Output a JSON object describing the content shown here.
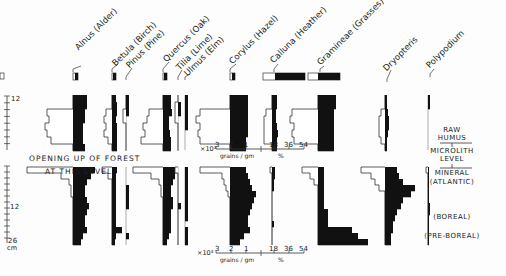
{
  "chart_data": {
    "type": "pollen-diagram",
    "title": "",
    "taxa": [
      {
        "key": "alnus",
        "label": "Alnus (Alder)",
        "x": 73
      },
      {
        "key": "betula",
        "label": "Betula (Birch)",
        "x": 112
      },
      {
        "key": "pinus",
        "label": "Pinus (Pine)",
        "x": 126
      },
      {
        "key": "quercus",
        "label": "Quercus (Oak)",
        "x": 163
      },
      {
        "key": "tilia",
        "label": "Tilia (Lime)",
        "x": 178
      },
      {
        "key": "ulmus",
        "label": "Ulmus (Elm)",
        "x": 185
      },
      {
        "key": "corylus",
        "label": "Corylus (Hazel)",
        "x": 230
      },
      {
        "key": "calluna",
        "label": "Calluna (Heather)",
        "x": 272
      },
      {
        "key": "gramineae",
        "label": "Gramineae (Grasses)",
        "x": 318
      },
      {
        "key": "dryopteris",
        "label": "Dryopteris",
        "x": 385
      },
      {
        "key": "polypodium",
        "label": "Polypodium",
        "x": 428
      }
    ],
    "depth_axis": {
      "unit": "cm",
      "upper_section": {
        "ticks": [
          "12",
          "7"
        ],
        "labels_shown": [
          "12"
        ]
      },
      "lower_section": {
        "ticks": [
          "0",
          "12",
          "26"
        ],
        "labels_shown": [
          "12",
          "26"
        ]
      }
    },
    "scale_bar": {
      "prefix": "×10³",
      "absolute_ticks": [
        "3",
        "2",
        "1"
      ],
      "absolute_unit": "grains / gm",
      "percent_ticks": [
        "18",
        "36",
        "54"
      ],
      "percent_unit": "%"
    },
    "annotations": [
      "OPENING UP OF FOREST",
      "AT THIS LEVEL"
    ],
    "zones": [
      "RAW HUMUS",
      "MICROLITH LEVEL",
      "MINERAL",
      "(ATLANTIC)",
      "(BOREAL)",
      "(PRE-BOREAL)"
    ],
    "note": "Black bars = percentage; open outlines = absolute frequency (×10³ grains/gm), drawn leftwards from baseline.",
    "upper_profile": {
      "y_top": 95,
      "y_bottom": 150,
      "row_h": 7,
      "series": [
        {
          "key": "alnus",
          "pct": [
            14,
            14,
            12,
            12,
            10,
            10,
            10,
            12
          ],
          "abs": [
            0,
            0,
            26,
            24,
            28,
            26,
            22,
            0
          ]
        },
        {
          "key": "betula",
          "pct": [
            4,
            5,
            5,
            4,
            5,
            5,
            5,
            5
          ],
          "abs": [
            0,
            0,
            6,
            8,
            6,
            8,
            4,
            0
          ]
        },
        {
          "key": "pinus",
          "pct": [
            3,
            3,
            3,
            0,
            0,
            0,
            0,
            0
          ],
          "abs": [
            0,
            0,
            3,
            3,
            0,
            0,
            0,
            0
          ]
        },
        {
          "key": "quercus",
          "pct": [
            8,
            8,
            9,
            6,
            6,
            7,
            8,
            8
          ],
          "abs": [
            0,
            0,
            14,
            16,
            20,
            18,
            22,
            0
          ]
        },
        {
          "key": "tilia",
          "pct": [
            0,
            3,
            3,
            0,
            0,
            0,
            0,
            0
          ],
          "abs": [
            0,
            3,
            3,
            3,
            0,
            0,
            0,
            0
          ]
        },
        {
          "key": "ulmus",
          "pct": [
            3,
            3,
            3,
            3,
            3,
            0,
            0,
            0
          ],
          "abs": [
            0,
            0,
            0,
            0,
            0,
            0,
            0,
            0
          ]
        },
        {
          "key": "corylus",
          "pct": [
            18,
            18,
            18,
            18,
            18,
            18,
            16,
            16
          ],
          "abs": [
            0,
            0,
            30,
            34,
            30,
            32,
            30,
            0
          ]
        },
        {
          "key": "calluna",
          "pct": [
            5,
            5,
            4,
            4,
            5,
            6,
            5,
            5
          ],
          "abs": [
            0,
            0,
            6,
            8,
            8,
            8,
            8,
            0
          ]
        },
        {
          "key": "gramineae",
          "pct": [
            18,
            18,
            16,
            16,
            16,
            16,
            16,
            16
          ],
          "abs": [
            0,
            0,
            26,
            28,
            24,
            26,
            24,
            0
          ]
        },
        {
          "key": "dryopteris",
          "pct": [
            2,
            2,
            3,
            4,
            4,
            3,
            2,
            2
          ],
          "abs": [
            0,
            0,
            4,
            6,
            6,
            6,
            4,
            0
          ]
        },
        {
          "key": "polypodium",
          "pct": [
            2,
            2,
            0,
            0,
            0,
            0,
            0,
            0
          ],
          "abs": [
            0,
            0,
            0,
            0,
            0,
            0,
            0,
            0
          ]
        }
      ]
    },
    "lower_profile": {
      "y_top": 167,
      "y_bottom": 245,
      "row_h": 6,
      "series": [
        {
          "key": "alnus",
          "pct": [
            22,
            18,
            14,
            12,
            12,
            14,
            16,
            14,
            12,
            12,
            14,
            10,
            8
          ],
          "abs": [
            46,
            12,
            4,
            2,
            2,
            0,
            0,
            0,
            0,
            0,
            0,
            0,
            0
          ]
        },
        {
          "key": "betula",
          "pct": [
            5,
            4,
            4,
            4,
            4,
            4,
            4,
            4,
            4,
            4,
            10,
            4,
            3
          ],
          "abs": [
            10,
            4,
            0,
            0,
            0,
            0,
            0,
            0,
            0,
            0,
            0,
            0,
            0
          ]
        },
        {
          "key": "pinus",
          "pct": [
            0,
            0,
            0,
            3,
            3,
            3,
            3,
            0,
            0,
            0,
            0,
            3,
            0
          ],
          "abs": [
            0,
            0,
            0,
            0,
            0,
            0,
            0,
            0,
            0,
            0,
            0,
            0,
            0
          ]
        },
        {
          "key": "quercus",
          "pct": [
            14,
            12,
            10,
            8,
            8,
            10,
            10,
            8,
            8,
            8,
            8,
            6,
            4
          ],
          "abs": [
            30,
            12,
            4,
            2,
            2,
            0,
            0,
            0,
            0,
            0,
            0,
            0,
            0
          ]
        },
        {
          "key": "tilia",
          "pct": [
            0,
            0,
            0,
            0,
            0,
            0,
            3,
            0,
            0,
            0,
            0,
            0,
            0
          ],
          "abs": [
            3,
            0,
            0,
            0,
            0,
            0,
            0,
            0,
            0,
            0,
            0,
            0,
            0
          ]
        },
        {
          "key": "ulmus",
          "pct": [
            3,
            3,
            3,
            3,
            3,
            3,
            3,
            3,
            3,
            0,
            3,
            3,
            3
          ],
          "abs": [
            0,
            0,
            0,
            0,
            0,
            0,
            0,
            0,
            0,
            0,
            0,
            0,
            0
          ]
        },
        {
          "key": "corylus",
          "pct": [
            16,
            18,
            20,
            22,
            26,
            24,
            22,
            20,
            18,
            18,
            20,
            14,
            10
          ],
          "abs": [
            30,
            8,
            6,
            4,
            2,
            0,
            0,
            0,
            0,
            0,
            0,
            0,
            0
          ]
        },
        {
          "key": "calluna",
          "pct": [
            3,
            3,
            2,
            2,
            0,
            0,
            0,
            0,
            0,
            2,
            0,
            0,
            0
          ],
          "abs": [
            2,
            0,
            0,
            0,
            0,
            0,
            0,
            0,
            0,
            0,
            0,
            0,
            0
          ]
        },
        {
          "key": "gramineae",
          "pct": [
            6,
            6,
            6,
            6,
            6,
            6,
            6,
            10,
            10,
            10,
            34,
            40,
            50
          ],
          "abs": [
            16,
            8,
            4,
            0,
            0,
            0,
            0,
            0,
            0,
            0,
            0,
            0,
            0
          ]
        },
        {
          "key": "dryopteris",
          "pct": [
            12,
            14,
            18,
            30,
            26,
            18,
            16,
            12,
            10,
            8,
            8,
            6,
            6
          ],
          "abs": [
            24,
            14,
            10,
            6,
            0,
            0,
            0,
            0,
            0,
            0,
            0,
            0,
            0
          ]
        },
        {
          "key": "polypodium",
          "pct": [
            1,
            1,
            1,
            1,
            1,
            1,
            2,
            2,
            1,
            1,
            1,
            1,
            1
          ],
          "abs": [
            2,
            0,
            0,
            0,
            0,
            0,
            0,
            0,
            0,
            0,
            0,
            0,
            0
          ]
        }
      ]
    },
    "surface_legend_bars": [
      {
        "key": "alnus",
        "x": 73,
        "w": 5,
        "open": 2
      },
      {
        "key": "betula",
        "x": 112,
        "w": 4,
        "open": 1
      },
      {
        "key": "quercus",
        "x": 163,
        "w": 4,
        "open": 1
      },
      {
        "key": "corylus",
        "x": 230,
        "w": 5,
        "open": 2
      },
      {
        "key": "calluna",
        "x": 263,
        "w": 42,
        "open": 12
      },
      {
        "key": "gramineae",
        "x": 308,
        "w": 32,
        "open": 10
      }
    ]
  },
  "depth_labels": {
    "upper_12": "12",
    "lower_12": "12",
    "lower_26": "26",
    "unit": "cm"
  },
  "annotation": {
    "line1": "OPENING UP OF FOREST",
    "line2": "AT THIS LEVEL"
  },
  "scale_upper": {
    "prefix": "×10³",
    "t3": "3",
    "t2": "2",
    "t1": "1",
    "p18": "18",
    "p36": "36",
    "p54": "54",
    "abs_unit": "grains / gm",
    "pct_unit": "%"
  },
  "scale_lower": {
    "prefix": "×10³",
    "t3": "3",
    "t2": "2",
    "t1": "1",
    "p18": "18",
    "p36": "36",
    "p54": "54",
    "abs_unit": "grains / gm",
    "pct_unit": "%"
  },
  "zones": {
    "raw_humus": "RAW HUMUS",
    "microlith_1": "MICROLITH",
    "microlith_2": "LEVEL",
    "mineral": "MINERAL",
    "atlantic": "(ATLANTIC)",
    "boreal": "(BOREAL)",
    "pre_boreal": "(PRE-BOREAL)"
  },
  "taxa_labels": {
    "alnus": "Alnus (Alder)",
    "betula": "Betula (Birch)",
    "pinus": "Pinus (Pine)",
    "quercus": "Quercus (Oak)",
    "tilia": "Tilia (Lime)",
    "ulmus": "Ulmus (Elm)",
    "corylus": "Corylus (Hazel)",
    "calluna": "Calluna (Heather)",
    "gramineae": "Gramineae (Grasses)",
    "dryopteris": "Dryopteris",
    "polypodium": "Polypodium"
  },
  "colors": {
    "ink": "#111111",
    "paper": "#fdfdfd",
    "outline": "#333333"
  }
}
